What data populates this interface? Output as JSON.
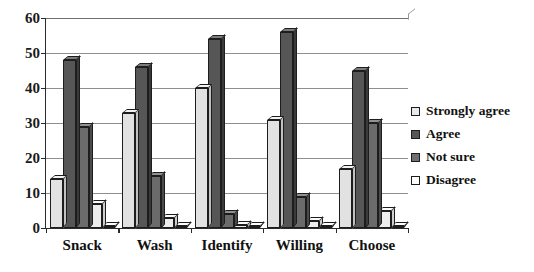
{
  "chart_data": {
    "type": "bar",
    "title": "",
    "xlabel": "",
    "ylabel": "",
    "ylim": [
      0,
      60
    ],
    "yticks": [
      0,
      10,
      20,
      30,
      40,
      50,
      60
    ],
    "grid": true,
    "legend_position": "right",
    "style": "3d-clustered-column",
    "categories": [
      "Snack",
      "Wash",
      "Identify",
      "Willing",
      "Choose"
    ],
    "series": [
      {
        "name": "Strongly agree",
        "color": "#e2e2e2",
        "values": [
          14,
          33,
          40,
          31,
          17
        ]
      },
      {
        "name": "Agree",
        "color": "#565656",
        "values": [
          48,
          46,
          54,
          56,
          45
        ]
      },
      {
        "name": "Not sure",
        "color": "#6b6b6b",
        "values": [
          29,
          15,
          4,
          9,
          30
        ]
      },
      {
        "name": "Disagree",
        "color": "#ededed",
        "values": [
          7,
          3,
          1,
          2,
          5
        ]
      },
      {
        "name": "",
        "color": "#f7f7f7",
        "values": [
          0.5,
          0.5,
          0.5,
          0.5,
          0.5
        ]
      }
    ]
  },
  "axis": {
    "y_tick_labels": [
      "0",
      "10",
      "20",
      "30",
      "40",
      "50",
      "60"
    ],
    "x_tick_labels": [
      "Snack",
      "Wash",
      "Identify",
      "Willing",
      "Choose"
    ]
  },
  "legend": {
    "items": [
      {
        "label": "Strongly agree",
        "swatch": "legend-swatch-strongly-agree"
      },
      {
        "label": "Agree",
        "swatch": "legend-swatch-agree"
      },
      {
        "label": "Not sure",
        "swatch": "legend-swatch-not-sure"
      },
      {
        "label": "Disagree",
        "swatch": "legend-swatch-disagree"
      }
    ]
  }
}
